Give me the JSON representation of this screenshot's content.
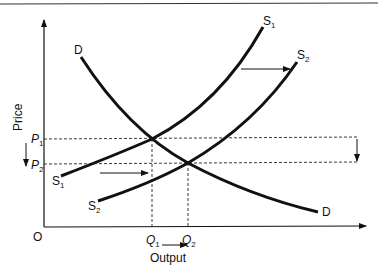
{
  "diagram": {
    "type": "supply-demand",
    "axes": {
      "x_label": "Output",
      "y_label": "Price",
      "origin_label": "O"
    },
    "curves": {
      "demand": {
        "start_label": "D",
        "end_label": "D"
      },
      "supply1": {
        "start_label": "S",
        "start_sub": "1",
        "end_label": "S",
        "end_sub": "1"
      },
      "supply2": {
        "start_label": "S",
        "start_sub": "2",
        "end_label": "S",
        "end_sub": "2"
      }
    },
    "prices": [
      {
        "label": "P",
        "sub": "1"
      },
      {
        "label": "P",
        "sub": "2"
      }
    ],
    "quantities": [
      {
        "label": "Q",
        "sub": "1"
      },
      {
        "label": "Q",
        "sub": "2"
      }
    ],
    "annotations": {
      "supply_shift": "rightward shift from S1 to S2",
      "price_change": "price falls from P1 to P2",
      "output_change": "output rises from Q1 to Q2"
    },
    "colors": {
      "ink": "#111111",
      "background": "#ffffff"
    }
  }
}
